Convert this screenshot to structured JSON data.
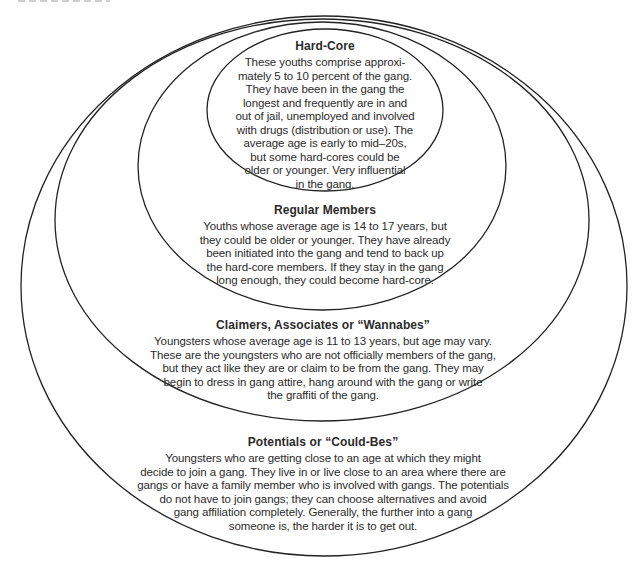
{
  "figure": {
    "background_color": "#ffffff",
    "stroke_color": "#222222",
    "text_color": "#2b2b2b",
    "levels": [
      {
        "id": "hard-core",
        "title": "Hard-Core",
        "body": "These youths comprise approxi-\nmately 5 to 10 percent of the gang.\nThey have been in the gang the\nlongest and frequently are in and\nout of jail, unemployed and involved\nwith drugs (distribution or use). The\naverage age is early to mid–20s,\nbut some hard-cores could be\nolder or younger. Very influential\nin the gang."
      },
      {
        "id": "regular-members",
        "title": "Regular Members",
        "body": "Youths whose average age is 14 to 17 years, but\nthey could be older or younger. They have already\nbeen initiated into the gang and tend to back up\nthe hard-core members. If they stay in the gang\nlong enough, they could become hard-core."
      },
      {
        "id": "claimers",
        "title": "Claimers, Associates or “Wannabes”",
        "body": "Youngsters whose average age is 11 to 13 years, but age may vary.\nThese are the youngsters who are not officially members of the gang,\nbut they act like they are or claim to be from the gang. They may\nbegin to dress in gang attire, hang around with the gang or write\nthe graffiti of the gang."
      },
      {
        "id": "potentials",
        "title": "Potentials or “Could-Bes”",
        "body": "Youngsters who are getting close to an age at which they might\ndecide to join a gang. They live in or live close to an area where there are\ngangs or have a family member who is involved with gangs. The potentials\ndo not have to join gangs; they can choose alternatives and avoid\ngang affiliation completely. Generally, the further into a gang\nsomeone is, the harder it is to get out."
      }
    ]
  }
}
